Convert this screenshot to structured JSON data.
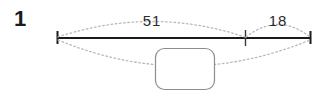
{
  "worksheet": {
    "problem_number": "1",
    "diagram": {
      "type": "number-bond-bar-model",
      "whole_label": "",
      "parts": [
        {
          "name": "left-part",
          "label": "51"
        },
        {
          "name": "right-part",
          "label": "18"
        }
      ],
      "answer_box": {
        "value": "",
        "placeholder": ""
      },
      "colors": {
        "line": "#1a1a1a",
        "arc": "#b9b9b9",
        "box_border": "#8d8d8d",
        "text": "#1b1b1b"
      }
    }
  }
}
